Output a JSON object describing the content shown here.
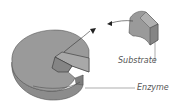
{
  "diagram": {
    "type": "lock-and-key enzyme model",
    "labels": {
      "substrate": "Substrate",
      "enzyme": "Enzyme"
    },
    "colors": {
      "shape_fill": "#9a9a9a",
      "shape_dark": "#7e7e7e",
      "outline": "#333333",
      "leader_line": "#777777",
      "text": "#555555"
    }
  }
}
